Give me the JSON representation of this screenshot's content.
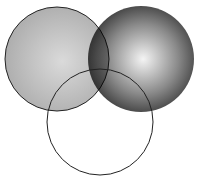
{
  "diagram": {
    "type": "venn",
    "circle_count": 3,
    "background": "#ffffff",
    "circles": [
      {
        "id": "left",
        "cx": 57,
        "cy": 59,
        "r": 52,
        "fill_style": "radial-gradient",
        "gradient_center": "#dadada",
        "gradient_edge": "#aaaaaa",
        "stroke": "#222222",
        "stroke_width": 1
      },
      {
        "id": "right",
        "cx": 141,
        "cy": 59,
        "r": 53,
        "fill_style": "radial-gradient",
        "gradient_center": "#f4f4f4",
        "gradient_edge": "#3a3a3a",
        "stroke": "none",
        "stroke_width": 0
      },
      {
        "id": "bottom",
        "cx": 100,
        "cy": 122,
        "r": 53,
        "fill_style": "none",
        "stroke": "#222222",
        "stroke_width": 1
      }
    ],
    "labels": []
  }
}
